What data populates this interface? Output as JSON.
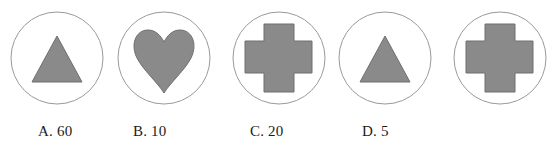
{
  "figure": {
    "type": "shape-sequence-question",
    "stroke_color": "#9a9a9a",
    "shape_fill_color": "#8a8a8a",
    "shape_stroke_color": "#6f6f6f",
    "text_color": "#1b1b1b",
    "background_color": "#ffffff",
    "circle_radius": 46,
    "items": [
      {
        "index": 1,
        "shape": "triangle-icon",
        "shape_label": "triangle",
        "center_x": 57,
        "center_y": 58
      },
      {
        "index": 2,
        "shape": "heart-icon",
        "shape_label": "heart",
        "center_x": 164,
        "center_y": 58
      },
      {
        "index": 3,
        "shape": "cross-icon",
        "shape_label": "cross",
        "center_x": 279,
        "center_y": 58
      },
      {
        "index": 4,
        "shape": "triangle-icon",
        "shape_label": "triangle",
        "center_x": 385,
        "center_y": 58
      },
      {
        "index": 5,
        "shape": "cross-icon",
        "shape_label": "cross",
        "center_x": 500,
        "center_y": 58
      }
    ]
  },
  "options": [
    {
      "key": "A",
      "value": "60",
      "text": "A. 60",
      "x": 38
    },
    {
      "key": "B",
      "value": "10",
      "text": "B. 10",
      "x": 133
    },
    {
      "key": "C",
      "value": "20",
      "text": "C. 20",
      "x": 250
    },
    {
      "key": "D",
      "value": "5",
      "text": "D. 5",
      "x": 362
    }
  ]
}
